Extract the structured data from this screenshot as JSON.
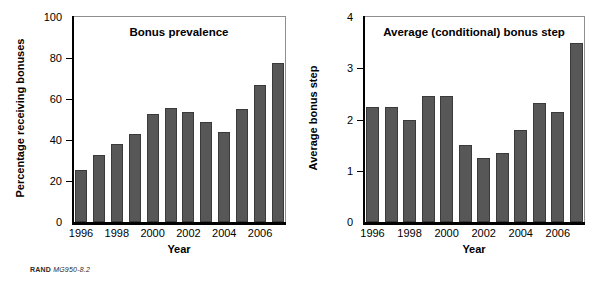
{
  "figure": {
    "footer_brand": "RAND",
    "footer_id": "MG950-8.2"
  },
  "chart_data": [
    {
      "type": "bar",
      "title": "Bonus prevalence",
      "xlabel": "Year",
      "ylabel": "Percentage receiving bonuses",
      "categories": [
        "1996",
        "1997",
        "1998",
        "1999",
        "2000",
        "2001",
        "2002",
        "2003",
        "2004",
        "2005",
        "2006",
        "2007"
      ],
      "tick_labels": [
        "1996",
        "",
        "1998",
        "",
        "2000",
        "",
        "2002",
        "",
        "2004",
        "",
        "2006",
        ""
      ],
      "values": [
        25.5,
        32.5,
        38,
        43,
        52.5,
        55.5,
        53.5,
        49,
        44,
        55,
        67,
        77.5
      ],
      "ylim": [
        0,
        100
      ],
      "yticks": [
        0,
        20,
        40,
        60,
        80,
        100
      ],
      "ytick_labels": [
        "0",
        "20",
        "40",
        "60",
        "80",
        "100"
      ],
      "grid": false,
      "legend": "none",
      "bar_color": "#575757",
      "bar_edge_color": "#3a3a3a"
    },
    {
      "type": "bar",
      "title": "Average (conditional) bonus step",
      "xlabel": "Year",
      "ylabel": "Average bonus step",
      "categories": [
        "1996",
        "1997",
        "1998",
        "1999",
        "2000",
        "2001",
        "2002",
        "2003",
        "2004",
        "2005",
        "2006",
        "2007"
      ],
      "tick_labels": [
        "1996",
        "",
        "1998",
        "",
        "2000",
        "",
        "2002",
        "",
        "2004",
        "",
        "2006",
        ""
      ],
      "values": [
        2.25,
        2.25,
        2.0,
        2.45,
        2.45,
        1.5,
        1.25,
        1.35,
        1.8,
        2.33,
        2.15,
        3.5
      ],
      "ylim": [
        0,
        4
      ],
      "yticks": [
        0,
        1,
        2,
        3,
        4
      ],
      "ytick_labels": [
        "0",
        "1",
        "2",
        "3",
        "4"
      ],
      "grid": false,
      "legend": "none",
      "bar_color": "#575757",
      "bar_edge_color": "#3a3a3a"
    }
  ]
}
